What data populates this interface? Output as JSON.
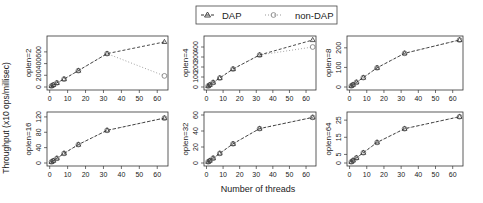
{
  "figure": {
    "y_label": "Throughput (x10 ops/millisec)",
    "x_label": "Number of threads",
    "legend": [
      {
        "label": "DAP",
        "marker": "triangle",
        "line": "dashed",
        "color": "#333333"
      },
      {
        "label": "non-DAP",
        "marker": "circle",
        "line": "dotted",
        "color": "#999999"
      }
    ]
  },
  "chart_data": [
    {
      "type": "line",
      "title": "oplen=2",
      "panel_label": "oplen=2",
      "x": [
        1,
        2,
        4,
        8,
        16,
        32,
        64
      ],
      "xticks": [
        0,
        10,
        20,
        30,
        40,
        50,
        60
      ],
      "yticks": [
        0,
        200,
        400,
        600
      ],
      "ylim": [
        0,
        820
      ],
      "series": [
        {
          "name": "DAP",
          "values": [
            18,
            36,
            70,
            135,
            280,
            570,
            770
          ]
        },
        {
          "name": "non-DAP",
          "values": [
            18,
            36,
            70,
            135,
            280,
            570,
            190
          ]
        }
      ],
      "xlabel": "",
      "ylabel": "Throughput (x10 ops/millisec)",
      "grid": false
    },
    {
      "type": "line",
      "title": "oplen=4",
      "panel_label": "oplen=4",
      "x": [
        1,
        2,
        4,
        8,
        16,
        32,
        64
      ],
      "xticks": [
        0,
        10,
        20,
        30,
        40,
        50,
        60
      ],
      "yticks": [
        0,
        100,
        200,
        300,
        400
      ],
      "ylim": [
        0,
        480
      ],
      "series": [
        {
          "name": "DAP",
          "values": [
            10,
            22,
            45,
            90,
            180,
            320,
            470
          ]
        },
        {
          "name": "non-DAP",
          "values": [
            10,
            22,
            45,
            90,
            180,
            320,
            400
          ]
        }
      ],
      "xlabel": "",
      "ylabel": "",
      "grid": false
    },
    {
      "type": "line",
      "title": "oplen=8",
      "panel_label": "oplen=8",
      "x": [
        1,
        2,
        4,
        8,
        16,
        32,
        64
      ],
      "xticks": [
        0,
        10,
        20,
        30,
        40,
        50,
        60
      ],
      "yticks": [
        0,
        100,
        200
      ],
      "ylim": [
        0,
        245
      ],
      "series": [
        {
          "name": "DAP",
          "values": [
            6,
            12,
            24,
            48,
            98,
            172,
            240
          ]
        },
        {
          "name": "non-DAP",
          "values": [
            6,
            12,
            24,
            48,
            98,
            172,
            240
          ]
        }
      ],
      "xlabel": "",
      "ylabel": "",
      "grid": false
    },
    {
      "type": "line",
      "title": "oplen=16",
      "panel_label": "oplen=16",
      "x": [
        1,
        2,
        4,
        8,
        16,
        32,
        64
      ],
      "xticks": [
        0,
        10,
        20,
        30,
        40,
        50,
        60
      ],
      "yticks": [
        0,
        40,
        80,
        120
      ],
      "ylim": [
        0,
        125
      ],
      "series": [
        {
          "name": "DAP",
          "values": [
            3,
            6,
            12,
            25,
            48,
            85,
            117
          ]
        },
        {
          "name": "non-DAP",
          "values": [
            3,
            6,
            12,
            25,
            48,
            85,
            117
          ]
        }
      ],
      "xlabel": "",
      "ylabel": "Throughput (x10 ops/millisec)",
      "grid": false
    },
    {
      "type": "line",
      "title": "oplen=32",
      "panel_label": "oplen=32",
      "x": [
        1,
        2,
        4,
        8,
        16,
        32,
        64
      ],
      "xticks": [
        0,
        10,
        20,
        30,
        40,
        50,
        60
      ],
      "yticks": [
        0,
        20,
        40,
        60
      ],
      "ylim": [
        0,
        60
      ],
      "series": [
        {
          "name": "DAP",
          "values": [
            1.5,
            3,
            6,
            12,
            24,
            43,
            57
          ]
        },
        {
          "name": "non-DAP",
          "values": [
            1.5,
            3,
            6,
            12,
            24,
            43,
            57
          ]
        }
      ],
      "xlabel": "Number of threads",
      "ylabel": "",
      "grid": false
    },
    {
      "type": "line",
      "title": "oplen=64",
      "panel_label": "oplen=64",
      "x": [
        1,
        2,
        4,
        8,
        16,
        32,
        64
      ],
      "xticks": [
        0,
        10,
        20,
        30,
        40,
        50,
        60
      ],
      "yticks": [
        0,
        5,
        15,
        25
      ],
      "ylim": [
        0,
        28
      ],
      "series": [
        {
          "name": "DAP",
          "values": [
            0.7,
            1.5,
            3,
            6,
            12,
            20,
            27
          ]
        },
        {
          "name": "non-DAP",
          "values": [
            0.7,
            1.5,
            3,
            6,
            12,
            20,
            27
          ]
        }
      ],
      "xlabel": "",
      "ylabel": "",
      "grid": false
    }
  ]
}
